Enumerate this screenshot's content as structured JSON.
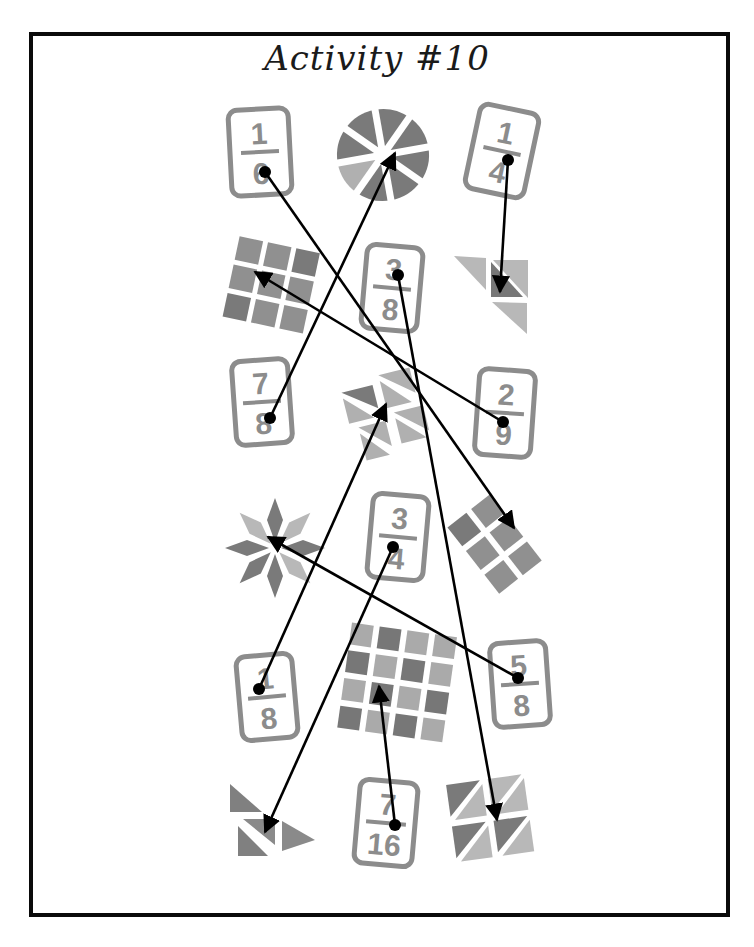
{
  "title": "Activity #10",
  "colors": {
    "border": "#0a0a0a",
    "card_gray": "#8c8c8c",
    "dark_fill": "#7a7a7a",
    "light_fill": "#b0b0b0",
    "line": "#000000"
  },
  "cards": [
    {
      "id": "card-1-6",
      "numerator": "1",
      "denominator": "6"
    },
    {
      "id": "card-1-4",
      "numerator": "1",
      "denominator": "4"
    },
    {
      "id": "card-3-8",
      "numerator": "3",
      "denominator": "8"
    },
    {
      "id": "card-7-8",
      "numerator": "7",
      "denominator": "8"
    },
    {
      "id": "card-2-9",
      "numerator": "2",
      "denominator": "9"
    },
    {
      "id": "card-3-4",
      "numerator": "3",
      "denominator": "4"
    },
    {
      "id": "card-1-8",
      "numerator": "1",
      "denominator": "8"
    },
    {
      "id": "card-5-8",
      "numerator": "5",
      "denominator": "8"
    },
    {
      "id": "card-7-16",
      "numerator": "7",
      "denominator": "16"
    }
  ],
  "shapes": [
    {
      "id": "pie-8-slices",
      "shaded": 7,
      "total": 8
    },
    {
      "id": "grid-3x3",
      "shaded": 2,
      "total": 9
    },
    {
      "id": "triangles-4",
      "shaded": 1,
      "total": 4
    },
    {
      "id": "triangles-8-center",
      "shaded": 1,
      "total": 8
    },
    {
      "id": "grid-6",
      "shaded": 1,
      "total": 6
    },
    {
      "id": "star-8",
      "shaded": 5,
      "total": 8
    },
    {
      "id": "grid-4x4",
      "shaded": 7,
      "total": 16
    },
    {
      "id": "triangles-bottom-left",
      "shaded": 3,
      "total": 4
    },
    {
      "id": "triangles-bottom-right",
      "shaded": 3,
      "total": 8
    }
  ],
  "connections": [
    {
      "from": "card-1-6",
      "to": "grid-6"
    },
    {
      "from": "card-7-8",
      "to": "pie-8-slices"
    },
    {
      "from": "card-1-4",
      "to": "triangles-4"
    },
    {
      "from": "card-2-9",
      "to": "grid-3x3"
    },
    {
      "from": "card-3-8",
      "to": "triangles-bottom-right"
    },
    {
      "from": "card-3-4",
      "to": "triangles-bottom-left"
    },
    {
      "from": "card-1-8",
      "to": "triangles-8-center"
    },
    {
      "from": "card-5-8",
      "to": "star-8"
    },
    {
      "from": "card-7-16",
      "to": "grid-4x4"
    }
  ]
}
